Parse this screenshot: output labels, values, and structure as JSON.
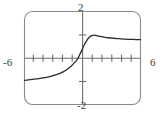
{
  "figure": {
    "kind": "graphing-calculator-viewport",
    "window_labels": {
      "x_min": "-6",
      "x_max": "6",
      "y_max": "2",
      "y_min": "-2"
    },
    "colors": {
      "curve": "#2b2b2b",
      "axis": "#6e6e6e",
      "frame": "#8a8a8a",
      "background": "#ffffff",
      "text": "#3a3a3a"
    }
  },
  "chart_data": {
    "type": "line",
    "title": "",
    "subtitle": "",
    "xlabel": "",
    "ylabel": "",
    "xlim": [
      -6,
      6
    ],
    "ylim": [
      -2,
      2
    ],
    "grid": false,
    "legend": null,
    "legend_position": "none",
    "xticks": [
      -5,
      -4,
      -3,
      -2,
      -1,
      1,
      2,
      3,
      4,
      5
    ],
    "xtick_labels": [
      "",
      "",
      "",
      "",
      "",
      "",
      "",
      "",
      "",
      ""
    ],
    "yticks": [
      1,
      -1
    ],
    "ytick_labels": [
      "",
      ""
    ],
    "axis_end_labels": {
      "left": "-6",
      "right": "6",
      "top": "2",
      "bottom": "-2"
    },
    "annotations": [],
    "series": [
      {
        "name": "curve",
        "x": [
          -6.0,
          -5.6,
          -5.2,
          -4.8,
          -4.4,
          -4.0,
          -3.6,
          -3.2,
          -2.8,
          -2.4,
          -2.0,
          -1.7,
          -1.4,
          -1.1,
          -0.8,
          -0.5,
          -0.2,
          0.0,
          0.2,
          0.45,
          0.7,
          0.95,
          1.2,
          1.5,
          1.8,
          2.2,
          2.7,
          3.2,
          3.8,
          4.4,
          5.0,
          5.6,
          6.0
        ],
        "y": [
          -0.96,
          -0.94,
          -0.92,
          -0.9,
          -0.88,
          -0.85,
          -0.82,
          -0.78,
          -0.73,
          -0.67,
          -0.6,
          -0.52,
          -0.43,
          -0.32,
          -0.19,
          -0.04,
          0.22,
          0.4,
          0.58,
          0.76,
          0.89,
          0.96,
          0.98,
          0.96,
          0.93,
          0.9,
          0.87,
          0.85,
          0.83,
          0.81,
          0.8,
          0.79,
          0.79
        ]
      }
    ]
  }
}
